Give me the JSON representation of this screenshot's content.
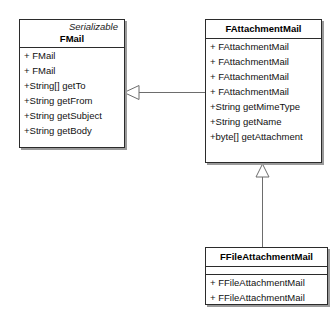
{
  "diagram": {
    "type": "uml-class-diagram",
    "background": "#ffffff",
    "line_color": "#6d6d6d",
    "border_color": "#2b2b2b",
    "shadow_color": "#9a9a9a"
  },
  "classes": {
    "fmail": {
      "stereotype": "Serializable",
      "name": "FMail",
      "members": [
        "+ FMail",
        "+ FMail",
        "+String[] getTo",
        "+String getFrom",
        "+String getSubject",
        "+String getBody"
      ]
    },
    "fattachmentmail": {
      "name": "FAttachmentMail",
      "members": [
        "+ FAttachmentMail",
        "+ FAttachmentMail",
        "+ FAttachmentMail",
        "+ FAttachmentMail",
        "+String getMimeType",
        "+String getName",
        "+byte[] getAttachment"
      ]
    },
    "ffileattachmentmail": {
      "name": "FFileAttachmentMail",
      "members": [
        "+ FFileAttachmentMail",
        "+ FFileAttachmentMail"
      ]
    }
  },
  "relations": [
    {
      "name": "generalization-fattachmentmail-to-fmail",
      "kind": "generalization",
      "from": "FAttachmentMail",
      "to": "FMail",
      "arrow": "hollow-triangle"
    },
    {
      "name": "generalization-ffileattachmentmail-to-fattachmentmail",
      "kind": "generalization",
      "from": "FFileAttachmentMail",
      "to": "FAttachmentMail",
      "arrow": "hollow-triangle"
    }
  ]
}
